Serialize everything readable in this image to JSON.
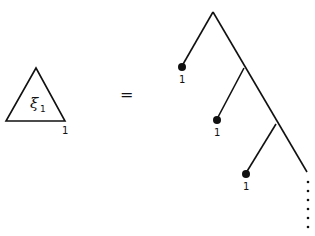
{
  "diagram": {
    "lhs": {
      "symbol": "ξ",
      "subscript": "1",
      "corner_label": "1"
    },
    "equals": "=",
    "rhs": {
      "leaves": [
        {
          "label": "1"
        },
        {
          "label": "1"
        },
        {
          "label": "1"
        }
      ],
      "continuation": "⋮"
    }
  }
}
